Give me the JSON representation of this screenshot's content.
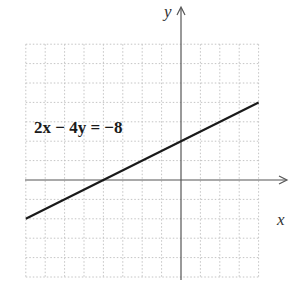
{
  "chart_data": {
    "type": "line",
    "title": "",
    "xlabel": "x",
    "ylabel": "y",
    "annotation": "2x − 4y = −8",
    "series": [
      {
        "name": "2x − 4y = −8",
        "equation": "y = x/2 + 2",
        "x": [
          -8,
          -4,
          0,
          4
        ],
        "y": [
          -2,
          0,
          2,
          4
        ]
      }
    ],
    "xlim": [
      -8,
      4
    ],
    "ylim": [
      -5,
      7
    ],
    "grid": true,
    "grid_style": "dotted",
    "x_intercept": -4,
    "y_intercept": 2,
    "legend": "none"
  },
  "labels": {
    "x_axis": "x",
    "y_axis": "y",
    "equation": "2x − 4y = −8"
  },
  "colors": {
    "grid": "#bdbdbd",
    "axis": "#555555",
    "line": "#1a1a1a"
  }
}
